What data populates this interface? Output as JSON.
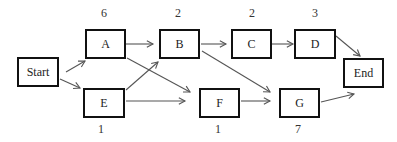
{
  "diagram": {
    "type": "activity-on-node network",
    "nodes": [
      {
        "id": "start",
        "label": "Start",
        "x": 17,
        "y": 57,
        "w": 42,
        "h": 30
      },
      {
        "id": "A",
        "label": "A",
        "x": 85,
        "y": 29,
        "w": 41,
        "h": 30,
        "duration": "6"
      },
      {
        "id": "E",
        "label": "E",
        "x": 83,
        "y": 88,
        "w": 42,
        "h": 30,
        "duration": "1"
      },
      {
        "id": "B",
        "label": "B",
        "x": 159,
        "y": 29,
        "w": 41,
        "h": 30,
        "duration": "2"
      },
      {
        "id": "C",
        "label": "C",
        "x": 231,
        "y": 29,
        "w": 41,
        "h": 30,
        "duration": "2"
      },
      {
        "id": "D",
        "label": "D",
        "x": 294,
        "y": 29,
        "w": 42,
        "h": 30,
        "duration": "3"
      },
      {
        "id": "F",
        "label": "F",
        "x": 199,
        "y": 88,
        "w": 41,
        "h": 30,
        "duration": "1"
      },
      {
        "id": "G",
        "label": "G",
        "x": 279,
        "y": 88,
        "w": 41,
        "h": 30,
        "duration": "7"
      },
      {
        "id": "end",
        "label": "End",
        "x": 343,
        "y": 58,
        "w": 41,
        "h": 30
      }
    ],
    "edges": [
      {
        "from": "Start",
        "to": "A",
        "x1": 66,
        "y1": 72,
        "x2": 85,
        "y2": 61
      },
      {
        "from": "Start",
        "to": "E",
        "x1": 60,
        "y1": 79,
        "x2": 80,
        "y2": 88
      },
      {
        "from": "A",
        "to": "B",
        "x1": 126,
        "y1": 44,
        "x2": 153,
        "y2": 44
      },
      {
        "from": "A",
        "to": "F",
        "x1": 127,
        "y1": 58,
        "x2": 190,
        "y2": 92
      },
      {
        "from": "E",
        "to": "B",
        "x1": 126,
        "y1": 90,
        "x2": 158,
        "y2": 62
      },
      {
        "from": "E",
        "to": "F",
        "x1": 126,
        "y1": 101,
        "x2": 185,
        "y2": 101
      },
      {
        "from": "B",
        "to": "C",
        "x1": 201,
        "y1": 44,
        "x2": 226,
        "y2": 44
      },
      {
        "from": "B",
        "to": "G",
        "x1": 202,
        "y1": 51,
        "x2": 270,
        "y2": 92
      },
      {
        "from": "C",
        "to": "D",
        "x1": 272,
        "y1": 44,
        "x2": 293,
        "y2": 44
      },
      {
        "from": "D",
        "to": "End",
        "x1": 336,
        "y1": 36,
        "x2": 360,
        "y2": 56
      },
      {
        "from": "F",
        "to": "G",
        "x1": 241,
        "y1": 101,
        "x2": 270,
        "y2": 101
      },
      {
        "from": "G",
        "to": "End",
        "x1": 321,
        "y1": 102,
        "x2": 354,
        "y2": 94
      }
    ],
    "durations_top": [
      {
        "node": "A",
        "value": "6",
        "x": 94,
        "y": 6
      },
      {
        "node": "B",
        "value": "2",
        "x": 168,
        "y": 6
      },
      {
        "node": "C",
        "value": "2",
        "x": 242,
        "y": 6
      },
      {
        "node": "D",
        "value": "3",
        "x": 305,
        "y": 6
      }
    ],
    "durations_bottom": [
      {
        "node": "E",
        "value": "1",
        "x": 91,
        "y": 122
      },
      {
        "node": "F",
        "value": "1",
        "x": 208,
        "y": 122
      },
      {
        "node": "G",
        "value": "7",
        "x": 288,
        "y": 122
      }
    ]
  },
  "colors": {
    "box_border": "#111111",
    "arrow": "#555555",
    "text": "#222222"
  }
}
